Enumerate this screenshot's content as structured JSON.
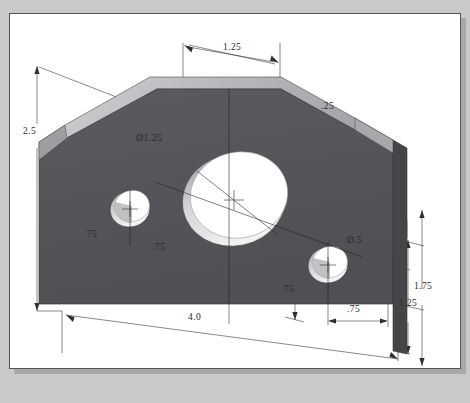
{
  "document": {
    "clipped_heading": "",
    "sheet_background": "#ffffff",
    "page_background": "#c9c9c9",
    "border_color": "#555555"
  },
  "model": {
    "name": "chamfered-bracket-plate",
    "face_colors": {
      "front": "#55555a",
      "top_edge": "#b9b9bd",
      "right_edge": "#4a4a4f",
      "chamfer": "#8e8e93",
      "hole_highlight": "#ffffff",
      "hole_shadow": "#b8b8bc"
    }
  },
  "dimensions": [
    {
      "id": "height-overall",
      "label": "2.5",
      "x": 22,
      "y": 118,
      "kind": "linear-vertical"
    },
    {
      "id": "top-offset",
      "label": "1.25",
      "x": 231,
      "y": 46,
      "kind": "linear-horizontal"
    },
    {
      "id": "chamfer",
      "label": ".25",
      "x": 327,
      "y": 104,
      "kind": "leader-chamfer"
    },
    {
      "id": "large-hole-diameter",
      "label": "Ø1.25",
      "x": 142,
      "y": 129,
      "kind": "diameter"
    },
    {
      "id": "small-hole-diameter",
      "label": "Ø.5",
      "x": 347,
      "y": 237,
      "kind": "diameter"
    },
    {
      "id": "left-hole-x",
      "label": ".75",
      "x": 88,
      "y": 232,
      "kind": "linear-horizontal"
    },
    {
      "id": "left-hole-y",
      "label": ".75",
      "x": 152,
      "y": 245,
      "kind": "linear-vertical"
    },
    {
      "id": "right-hole-y",
      "label": ".75",
      "x": 281,
      "y": 287,
      "kind": "linear-vertical"
    },
    {
      "id": "right-hole-x",
      "label": ".75",
      "x": 347,
      "y": 305,
      "kind": "linear-horizontal"
    },
    {
      "id": "length-overall",
      "label": "4.0",
      "x": 194,
      "y": 315,
      "kind": "linear-horizontal"
    },
    {
      "id": "right-height-inner",
      "label": "1.25",
      "x": 403,
      "y": 300,
      "kind": "linear-vertical"
    },
    {
      "id": "right-height-outer",
      "label": "1.75",
      "x": 417,
      "y": 283,
      "kind": "linear-vertical"
    }
  ]
}
